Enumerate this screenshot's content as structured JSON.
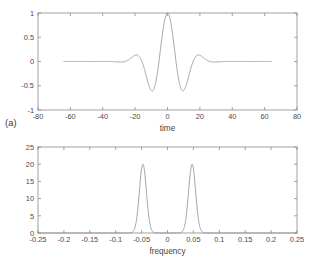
{
  "figure": {
    "background_color": "#ffffff",
    "line_color": "#8f8f8f",
    "axis_color": "#8b8b8b",
    "text_color": "#3a3a3a"
  },
  "panels": [
    {
      "tag": "(a)",
      "tag_name": "panel-tag-a"
    },
    {
      "tag": "(b)",
      "tag_name": "panel-tag-b"
    }
  ],
  "chart_data": [
    {
      "type": "line",
      "title": "",
      "subtitle": "",
      "panel_label": "(a)",
      "xlabel": "time",
      "ylabel": "",
      "xlim": [
        -80,
        80
      ],
      "ylim": [
        -1,
        1
      ],
      "xticks": [
        -80,
        -60,
        -40,
        -20,
        0,
        20,
        40,
        60,
        80
      ],
      "xticklabels": [
        "-80",
        "-60",
        "-40",
        "-20",
        "0",
        "20",
        "40",
        "60",
        "80"
      ],
      "yticks": [
        -1,
        -0.5,
        0,
        0.5,
        1
      ],
      "yticklabels": [
        "-1",
        "-0.5",
        "0",
        "0.5",
        "1"
      ],
      "grid": false,
      "legend": null,
      "legend_position": "none",
      "description": "Gabor wavelet: Gaussian-windowed cosine, unit peak at t=0, oscillation period about 20 time units, Gaussian envelope standard deviation about 10 time units",
      "series": [
        {
          "name": "gabor wavelet",
          "color": "#8f8f8f",
          "x_range": [
            -64,
            64
          ],
          "formula": "y = exp(-(t^2)/(2*10^2)) * cos(2*pi*0.0475*t)",
          "envelope_sigma": 10,
          "carrier_frequency": 0.0475,
          "peak_value": 1.0,
          "peak_at": 0,
          "local_extrema": [
            {
              "t": -64,
              "y": 0.03
            },
            {
              "t": -49,
              "y": 0.0
            },
            {
              "t": -39,
              "y": 0.07
            },
            {
              "t": -29,
              "y": 0.0
            },
            {
              "t": -29.5,
              "y": -0.17
            },
            {
              "t": -19,
              "y": 0.48
            },
            {
              "t": -9.5,
              "y": -0.78
            },
            {
              "t": 0,
              "y": 1.0
            },
            {
              "t": 9.5,
              "y": -0.78
            },
            {
              "t": 19,
              "y": 0.48
            },
            {
              "t": 29.5,
              "y": -0.17
            },
            {
              "t": 39,
              "y": 0.07
            },
            {
              "t": 64,
              "y": 0.03
            }
          ]
        }
      ]
    },
    {
      "type": "line",
      "title": "",
      "subtitle": "",
      "panel_label": "(b)",
      "xlabel": "frequency",
      "ylabel": "",
      "xlim": [
        -0.25,
        0.25
      ],
      "ylim": [
        0,
        25
      ],
      "xticks": [
        -0.25,
        -0.2,
        -0.15,
        -0.1,
        -0.05,
        0,
        0.05,
        0.1,
        0.15,
        0.2,
        0.25
      ],
      "xticklabels": [
        "-0.25",
        "-0.2",
        "-0.15",
        "-0.1",
        "-0.05",
        "0",
        "0.05",
        "0.1",
        "0.15",
        "0.2",
        "0.25"
      ],
      "yticks": [
        0,
        5,
        10,
        15,
        20,
        25
      ],
      "yticklabels": [
        "0",
        "5",
        "10",
        "15",
        "20",
        "25"
      ],
      "grid": false,
      "legend": null,
      "legend_position": "none",
      "description": "Magnitude spectrum of the Gabor wavelet: two symmetric Gaussian peaks centred at plus and minus 0.0475 cycles per sample, each of height 20",
      "series": [
        {
          "name": "magnitude spectrum",
          "color": "#8f8f8f",
          "formula": "Y = 20*exp(-((f-0.0475)^2)/(2*0.0068^2)) + 20*exp(-((f+0.0475)^2)/(2*0.0068^2))",
          "peaks": [
            {
              "frequency": -0.0475,
              "amplitude": 20
            },
            {
              "frequency": 0.0475,
              "amplitude": 20
            }
          ],
          "peak_sigma": 0.0068,
          "baseline": 0
        }
      ]
    }
  ]
}
